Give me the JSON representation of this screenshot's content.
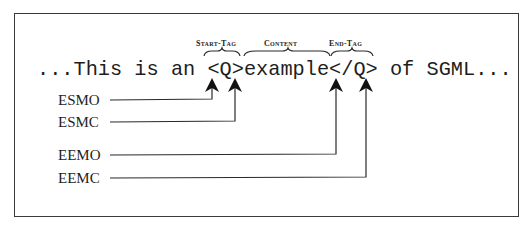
{
  "diagram": {
    "sentence": "...This is an <Q>example</Q> of SGML...",
    "braces": [
      {
        "label": "Start-Tag",
        "spans": "<Q>"
      },
      {
        "label": "Content",
        "spans": "example"
      },
      {
        "label": "End-Tag",
        "spans": "</Q>"
      }
    ],
    "pointers": [
      {
        "label": "ESMO",
        "points_to": "<"
      },
      {
        "label": "ESMC",
        "points_to": ">"
      },
      {
        "label": "EEMO",
        "points_to": "</"
      },
      {
        "label": "EEMC",
        "points_to": ">"
      }
    ],
    "colors": {
      "ink": "#1e1e1e",
      "frame": "#3a3a3a",
      "background": "#ffffff"
    }
  }
}
